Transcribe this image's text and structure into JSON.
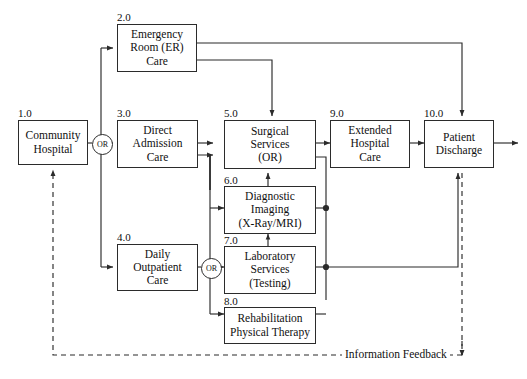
{
  "diagram": {
    "line_color": "#2b2b2b",
    "background": "#ffffff",
    "nodes": [
      {
        "id": "1.0",
        "lines": [
          "Community",
          "Hospital"
        ],
        "name": "community-hospital"
      },
      {
        "id": "2.0",
        "lines": [
          "Emergency",
          "Room (ER)",
          "Care"
        ],
        "name": "emergency-room-care"
      },
      {
        "id": "3.0",
        "lines": [
          "Direct",
          "Admission",
          "Care"
        ],
        "name": "direct-admission-care"
      },
      {
        "id": "4.0",
        "lines": [
          "Daily",
          "Outpatient",
          "Care"
        ],
        "name": "daily-outpatient-care"
      },
      {
        "id": "5.0",
        "lines": [
          "Surgical",
          "Services",
          "(OR)"
        ],
        "name": "surgical-services"
      },
      {
        "id": "6.0",
        "lines": [
          "Diagnostic",
          "Imaging",
          "(X-Ray/MRI)"
        ],
        "name": "diagnostic-imaging"
      },
      {
        "id": "7.0",
        "lines": [
          "Laboratory",
          "Services",
          "(Testing)"
        ],
        "name": "laboratory-services"
      },
      {
        "id": "8.0",
        "lines": [
          "Rehabilitation",
          "Physical Therapy"
        ],
        "name": "rehabilitation-physical-therapy"
      },
      {
        "id": "9.0",
        "lines": [
          "Extended",
          "Hospital",
          "Care"
        ],
        "name": "extended-hospital-care"
      },
      {
        "id": "10.0",
        "lines": [
          "Patient",
          "Discharge"
        ],
        "name": "patient-discharge"
      }
    ],
    "junctions": [
      {
        "label": "OR",
        "name": "or-junction-intake"
      },
      {
        "label": "OR",
        "name": "or-junction-ancillary"
      }
    ],
    "feedback": {
      "label": "Information Feedback",
      "style": "dashed"
    }
  }
}
